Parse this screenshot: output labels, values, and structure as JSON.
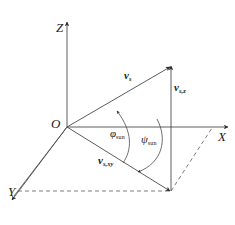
{
  "figure": {
    "type": "3d-vector-decomposition-diagram",
    "background_color": "#ffffff",
    "line_color": "#3a3a3a",
    "text_color": "#1a1a1a"
  },
  "axes": {
    "z": {
      "label": "Z"
    },
    "x": {
      "label": "X"
    },
    "y": {
      "label": "Y"
    },
    "origin": {
      "label": "O"
    }
  },
  "vectors": {
    "sun": {
      "symbol": "v",
      "subscript": "s"
    },
    "vertical_component": {
      "symbol": "v",
      "subscript": "s,z"
    },
    "horizontal_projection": {
      "symbol": "v",
      "subscript": "s,xy"
    }
  },
  "angles": {
    "elevation": {
      "symbol": "φ",
      "subscript": "sun"
    },
    "azimuth": {
      "symbol": "ψ",
      "subscript": "sun"
    }
  },
  "caption": {
    "text": ""
  }
}
